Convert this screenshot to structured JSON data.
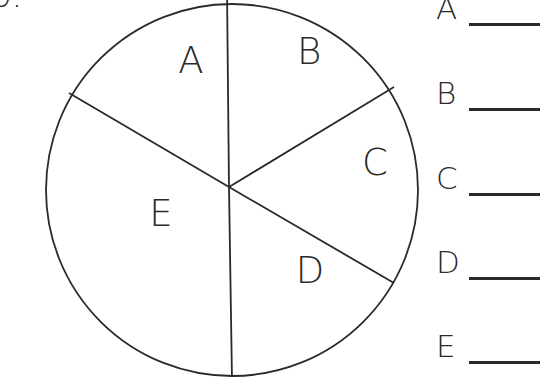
{
  "question": {
    "number_label": "b."
  },
  "diagram": {
    "type": "pie-division",
    "stroke_color": "#2a2a2a",
    "background": "#ffffff",
    "circle": {
      "cx": 232,
      "cy": 190,
      "r": 186
    },
    "hub": {
      "x": 229,
      "y": 187
    },
    "spokes": [
      {
        "name": "spoke-top",
        "x": 227,
        "y": -10
      },
      {
        "name": "spoke-upper-left",
        "x": 69,
        "y": 93
      },
      {
        "name": "spoke-upper-right",
        "x": 394,
        "y": 87
      },
      {
        "name": "spoke-lower-right",
        "x": 394,
        "y": 283
      },
      {
        "name": "spoke-bottom",
        "x": 232,
        "y": 380
      }
    ],
    "sections": [
      {
        "label": "A",
        "x": 191,
        "y": 73,
        "fraction": "1/6"
      },
      {
        "label": "B",
        "x": 309,
        "y": 64,
        "fraction": "1/6"
      },
      {
        "label": "C",
        "x": 375,
        "y": 175,
        "fraction": "1/6"
      },
      {
        "label": "D",
        "x": 310,
        "y": 283,
        "fraction": "1/6"
      },
      {
        "label": "E",
        "x": 161,
        "y": 226,
        "fraction": "1/3"
      }
    ]
  },
  "answers": [
    {
      "label": "A",
      "top": -4,
      "value": ""
    },
    {
      "label": "B",
      "top": 81,
      "value": ""
    },
    {
      "label": "C",
      "top": 166,
      "value": ""
    },
    {
      "label": "D",
      "top": 250,
      "value": ""
    },
    {
      "label": "E",
      "top": 334,
      "value": ""
    }
  ]
}
